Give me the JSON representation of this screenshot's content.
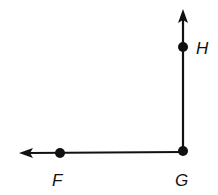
{
  "diagram": {
    "type": "angle",
    "colors": {
      "stroke": "#111111",
      "background": "#ffffff"
    },
    "points": [
      {
        "id": "F",
        "label": "F",
        "x": 60,
        "y": 153,
        "label_x": 52,
        "label_y": 186
      },
      {
        "id": "G",
        "label": "G",
        "x": 183,
        "y": 151,
        "label_x": 175,
        "label_y": 186
      },
      {
        "id": "H",
        "label": "H",
        "x": 183,
        "y": 47,
        "label_x": 196,
        "label_y": 54
      }
    ],
    "rays": [
      {
        "id": "ray-GF",
        "from": "G",
        "through": "F",
        "direction": "left"
      },
      {
        "id": "ray-GH",
        "from": "G",
        "through": "H",
        "direction": "up"
      }
    ]
  }
}
